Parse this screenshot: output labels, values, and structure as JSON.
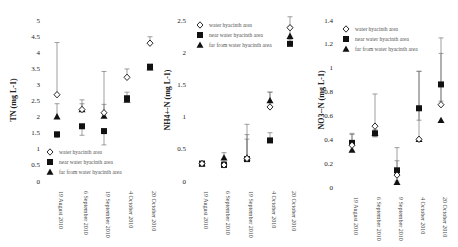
{
  "chart_data": [
    {
      "type": "scatter",
      "title": "",
      "xlabel": "",
      "ylabel": "TN (mg L-1)",
      "ylim": [
        0,
        5
      ],
      "yticks": [
        "0",
        "0.5",
        "1",
        "1.5",
        "2",
        "2.5",
        "3",
        "3.5",
        "4",
        "4.5",
        "5"
      ],
      "categories": [
        "19 August 2010",
        "6 September 2010",
        "19 September 2010",
        "4 October 2010",
        "20 October 2010"
      ],
      "legend_position": "lower-left",
      "grid": false,
      "series": [
        {
          "name": "water hyacinth area",
          "marker": "open-diamond",
          "values": [
            2.68,
            2.22,
            2.12,
            3.22,
            4.28
          ],
          "err_high": [
            4.3,
            2.52,
            3.4,
            3.48,
            4.48
          ]
        },
        {
          "name": "near water hyacinth area",
          "marker": "filled-square",
          "values": [
            1.45,
            1.7,
            1.55,
            2.57,
            3.55
          ],
          "err_low": [
            1.35,
            1.42,
            1.12,
            2.48,
            3.45
          ]
        },
        {
          "name": "far from water hyacinth area",
          "marker": "filled-triangle",
          "values": [
            2.0,
            2.22,
            2.02,
            2.52,
            3.52
          ],
          "err_high": [
            2.4,
            2.4,
            2.38,
            2.76,
            3.62
          ]
        }
      ]
    },
    {
      "type": "scatter",
      "title": "",
      "xlabel": "",
      "ylabel": "NH4+-N (mg L-1)",
      "ylim": [
        0,
        2.5
      ],
      "yticks": [
        "0",
        "0.5",
        "1",
        "1.5",
        "2",
        "2.5"
      ],
      "categories": [
        "19 August 2010",
        "6 September 2010",
        "19 September 2010",
        "4 October 2010",
        "20 October 2010"
      ],
      "legend_position": "upper-left",
      "grid": false,
      "series": [
        {
          "name": "water hyacinth area",
          "marker": "open-diamond",
          "values": [
            0.27,
            0.25,
            0.35,
            1.15,
            2.38
          ],
          "err_high": [
            0.3,
            0.3,
            0.72,
            1.38,
            2.55
          ]
        },
        {
          "name": "near water hyacinth area",
          "marker": "filled-square",
          "values": [
            0.27,
            0.25,
            0.34,
            0.63,
            2.13
          ],
          "err_high": [
            0.3,
            0.3,
            0.65,
            0.75,
            2.2
          ]
        },
        {
          "name": "far from water hyacinth area",
          "marker": "filled-triangle",
          "values": [
            0.27,
            0.36,
            0.36,
            1.25,
            2.25
          ],
          "err_high": [
            0.3,
            0.44,
            0.88,
            1.38,
            2.4
          ]
        }
      ]
    },
    {
      "type": "scatter",
      "title": "",
      "xlabel": "",
      "ylabel": "NO3--N (mg L-1)",
      "ylim": [
        0,
        1.4
      ],
      "yticks": [
        "0",
        "0.2",
        "0.4",
        "0.6",
        "0.8",
        "1",
        "1.2",
        "1.4"
      ],
      "categories": [
        "19 August 2010",
        "6 September 2010",
        "9 September 2010",
        "4 October 2010",
        "20 October 2010"
      ],
      "legend_position": "upper-left",
      "grid": false,
      "series": [
        {
          "name": "water hyacinth area",
          "marker": "open-diamond",
          "values": [
            0.35,
            0.51,
            0.1,
            0.4,
            0.69
          ],
          "err_high": [
            0.45,
            0.78,
            0.33,
            0.97,
            1.25
          ]
        },
        {
          "name": "near water hyacinth area",
          "marker": "filled-square",
          "values": [
            0.37,
            0.45,
            0.14,
            0.66,
            0.86
          ],
          "err_high": [
            0.44,
            0.48,
            0.22,
            0.97,
            1.12
          ],
          "err_low": [
            0.3,
            0.42,
            0.05,
            0.56,
            0.72
          ]
        },
        {
          "name": "far from water hyacinth area",
          "marker": "filled-triangle",
          "values": [
            0.31,
            0.45,
            0.04,
            0.4,
            0.56
          ]
        }
      ]
    }
  ],
  "legend": {
    "items": [
      {
        "label": "water hyacinth area",
        "marker": "open-diamond"
      },
      {
        "label": "near water hyacinth area",
        "marker": "filled-square"
      },
      {
        "label": "far from water hyacinth area",
        "marker": "filled-triangle"
      }
    ]
  }
}
